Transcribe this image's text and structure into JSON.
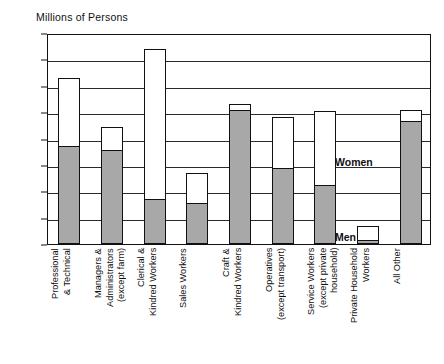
{
  "chart_data": {
    "type": "bar",
    "subtype": "stacked-bar",
    "title": "Millions of Persons",
    "xlabel": "",
    "ylabel": "Millions of Persons",
    "ylim": [
      0,
      16
    ],
    "ytick_step": 2,
    "yticks": [
      "16",
      "14",
      "12",
      "10",
      "8",
      "6",
      "4",
      "2",
      "0"
    ],
    "grid": true,
    "grid_axis": "y",
    "legend_position": "in-plot",
    "categories": [
      "Professional\n& Technical",
      "Managers &\nAdministrators\n(except farm)",
      "Clerical &\nKindred Workers",
      "Sales Workers",
      "Craft &\nKindred Workers",
      "Operatives\n(except transport)",
      "Service Workers\n(except private\nhousehold)",
      "Private Household\nWorkers",
      "All Other"
    ],
    "series": [
      {
        "name": "Men",
        "color": "#a8a8a8",
        "values": [
          7.4,
          7.1,
          3.4,
          3.1,
          10.2,
          5.8,
          4.5,
          0.3,
          9.3
        ]
      },
      {
        "name": "Women",
        "color": "#ffffff",
        "values": [
          5.2,
          1.8,
          11.4,
          2.3,
          0.4,
          3.8,
          5.6,
          1.1,
          0.9
        ]
      }
    ],
    "totals": [
      12.6,
      8.9,
      14.8,
      5.4,
      10.6,
      9.6,
      10.1,
      1.4,
      10.2
    ],
    "annotations": [
      {
        "text": "Women",
        "x_px": 287,
        "y_px": 121
      },
      {
        "text": "Men",
        "x_px": 287,
        "y_px": 196
      }
    ]
  },
  "legend": {
    "women_label": "Women",
    "men_label": "Men"
  }
}
